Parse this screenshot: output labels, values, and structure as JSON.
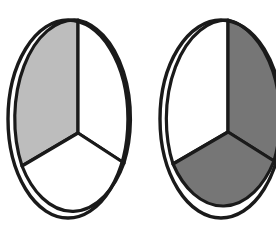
{
  "figure": {
    "background_color": "#ffffff",
    "stroke_color": "#1a1a1a",
    "blank_fill": "#ffffff",
    "light_gray": "#bdbdbd",
    "dark_gray": "#767676",
    "canvas": {
      "width": 276,
      "height": 235
    },
    "shapes": [
      {
        "name": "left-ellipse",
        "label": "Left ellipse",
        "center": {
          "x": 68,
          "y": 119
        },
        "radius": {
          "x": 60,
          "y": 99
        },
        "vertex": {
          "x": 78,
          "y": 133
        },
        "cropped": false,
        "wedges": [
          {
            "name": "upper-left-wedge",
            "label": "Upper left wedge",
            "fill": "#bdbdbd",
            "shaded": true,
            "path": "M 78 133 L 78 20 A 60 99 0 0 0 22 166 Z"
          },
          {
            "name": "upper-right-wedge",
            "label": "Upper right wedge",
            "fill": "#ffffff",
            "shaded": false,
            "path": "M 78 133 L 78 20 A 60 99 0 0 1 124 163 Z"
          },
          {
            "name": "bottom-wedge",
            "label": "Bottom wedge",
            "fill": "#ffffff",
            "shaded": false,
            "path": "M 78 133 L 124 163 A 60 99 0 0 1 22 166 Z"
          }
        ]
      },
      {
        "name": "right-ellipse",
        "label": "Right ellipse",
        "center": {
          "x": 221,
          "y": 119
        },
        "radius": {
          "x": 61,
          "y": 99
        },
        "vertex": {
          "x": 228,
          "y": 132
        },
        "cropped": true,
        "wedges": [
          {
            "name": "upper-left-wedge",
            "label": "Upper left wedge",
            "fill": "#ffffff",
            "shaded": false,
            "path": "M 228 132 L 228 20 A 61 99 0 0 0 173 164 Z"
          },
          {
            "name": "upper-right-wedge",
            "label": "Upper right wedge",
            "fill": "#767676",
            "shaded": true,
            "path": "M 228 132 L 228 20 A 61 99 0 0 1 274 161 Z"
          },
          {
            "name": "bottom-wedge",
            "label": "Bottom wedge",
            "fill": "#767676",
            "shaded": true,
            "path": "M 228 132 L 274 161 A 61 99 0 0 1 173 164 Z"
          }
        ]
      }
    ]
  }
}
